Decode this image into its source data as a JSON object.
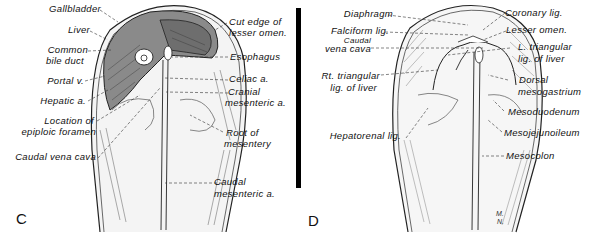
{
  "figure": {
    "panels": [
      {
        "id": "C",
        "letter": "C",
        "labels_left": [
          "Gallbladder",
          "Liver",
          "Common",
          "bile duct",
          "Portal v.",
          "Hepatic a.",
          "Location of",
          "epiploic foramen",
          "Caudal vena cava"
        ],
        "labels_right": [
          "Cut edge of",
          "lesser omen.",
          "Esophagus",
          "Celiac a.",
          "Cranial",
          "mesenteric a.",
          "Root of",
          "mesentery",
          "Caudal",
          "mesenteric a."
        ]
      },
      {
        "id": "D",
        "letter": "D",
        "labels_left": [
          "Diaphragm",
          "Falciform lig.",
          "Caudal",
          "vena cava",
          "Rt. triangular",
          "lig. of liver",
          "Hepatorenal lig."
        ],
        "labels_right": [
          "Coronary lig.",
          "Lesser omen.",
          "L. triangular",
          "lig. of liver",
          "Dorsal",
          "mesogastrium",
          "Mesoduodenum",
          "Mesojejunoileum",
          "Mesocolon"
        ],
        "signature": [
          "M.",
          "N."
        ]
      }
    ],
    "colors": {
      "ink": "#111111",
      "liver_shade": "#8a8a8a",
      "light_shade": "#d9d9d9",
      "divider": "#000000"
    }
  }
}
